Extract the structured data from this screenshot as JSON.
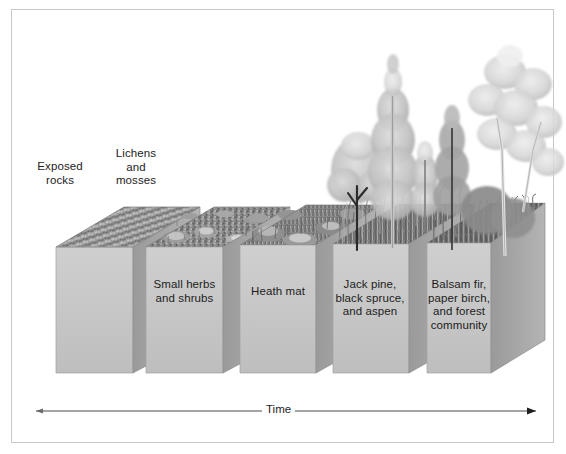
{
  "figure": {
    "type": "diagram",
    "border_color": "#c8c8c8",
    "background": "#ffffff"
  },
  "axis": {
    "label": "Time",
    "direction": "left-to-right",
    "arrowhead": "right"
  },
  "stages": [
    {
      "id": "stage-1",
      "label": "Exposed\nrocks",
      "label_position": "above-block",
      "surface": "bare rock rubble",
      "block_color": "#c2c2c2",
      "top_color": "#8e8e8e"
    },
    {
      "id": "stage-2",
      "label": "Lichens\nand\nmosses",
      "label_position": "above-block",
      "surface": "lichen and moss crust",
      "block_color": "#c2c2c2",
      "top_color": "#8e8e8e"
    },
    {
      "id": "stage-3",
      "label": "Small herbs\nand shrubs",
      "label_position": "inside-block",
      "surface": "low herbs with flowering clumps",
      "block_color": "#c2c2c2",
      "top_color": "#8e8e8e"
    },
    {
      "id": "stage-4",
      "label": "Heath mat",
      "label_position": "inside-block",
      "surface": "dense grassy heath mat",
      "block_color": "#c2c2c2",
      "top_color": "#8e8e8e"
    },
    {
      "id": "stage-5",
      "label": "Jack pine,\nblack spruce,\nand aspen",
      "label_position": "inside-block",
      "surface": "pioneer conifers and aspen trees",
      "block_color": "#c2c2c2",
      "top_color": "#8e8e8e"
    },
    {
      "id": "stage-6",
      "label": "Balsam fir,\npaper birch,\nand forest\ncommunity",
      "label_position": "inside-block",
      "surface": "mature mixed forest community",
      "block_color": "#c2c2c2",
      "top_color": "#8e8e8e"
    }
  ]
}
